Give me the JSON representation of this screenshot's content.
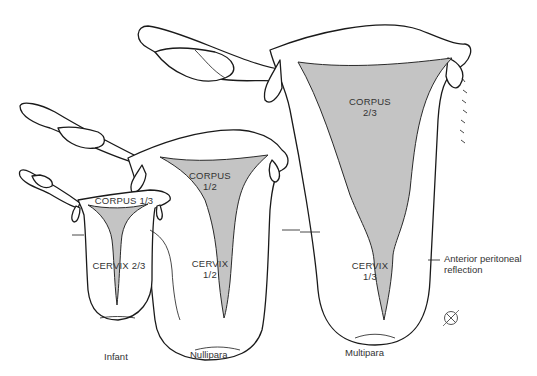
{
  "figure": {
    "uteri": [
      {
        "name": "Infant",
        "corpus_label": "CORPUS 1/3",
        "cervix_label": "CERVIX 2/3"
      },
      {
        "name": "Nullipara",
        "corpus_label_line1": "CORPUS",
        "corpus_label_line2": "1/2",
        "cervix_label_line1": "CERVIX",
        "cervix_label_line2": "1/2"
      },
      {
        "name": "Multipara",
        "corpus_label_line1": "CORPUS",
        "corpus_label_line2": "2/3",
        "cervix_label_line1": "CERVIX",
        "cervix_label_line2": "1/3"
      }
    ],
    "annotation": {
      "line1": "Anterior peritoneal",
      "line2": "reflection"
    },
    "symbol": "female-symbol",
    "colors": {
      "cavity": "#c4c4c4",
      "outline": "#1a1a1a",
      "background": "#ffffff"
    }
  }
}
